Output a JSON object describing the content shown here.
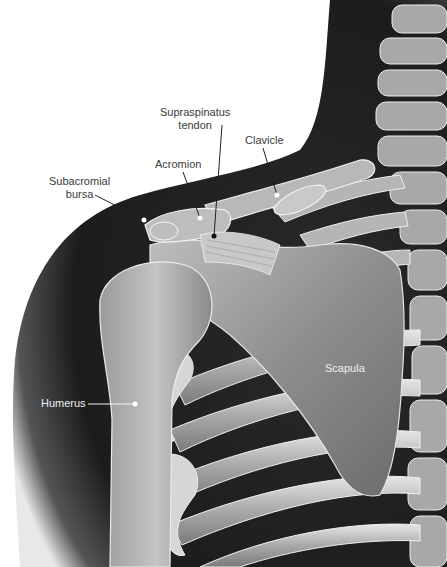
{
  "figure": {
    "colors": {
      "background": "#ffffff",
      "silhouette": "#1a1a1a",
      "bone": "#8a8a8a",
      "bone_highlight": "#d8d8d8",
      "label_dark": "#3a3a3a",
      "label_light": "#f0f0f0"
    }
  },
  "labels": {
    "supraspinatus": {
      "line1": "Supraspinatus",
      "line2": "tendon"
    },
    "clavicle": {
      "text": "Clavicle"
    },
    "acromion": {
      "text": "Acromion"
    },
    "subacromial": {
      "line1": "Subacromial",
      "line2": "bursa"
    },
    "scapula": {
      "text": "Scapula"
    },
    "humerus": {
      "text": "Humerus"
    }
  }
}
